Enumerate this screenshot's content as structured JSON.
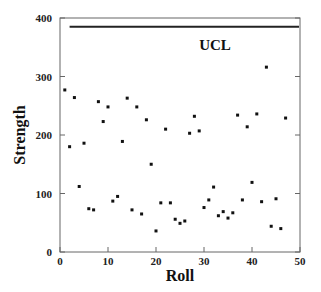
{
  "chart_data": {
    "type": "scatter",
    "title": "",
    "xlabel": "Roll",
    "ylabel": "Strength",
    "xlim": [
      0,
      50
    ],
    "ylim": [
      0,
      400
    ],
    "x_ticks": [
      0,
      10,
      20,
      30,
      40,
      50
    ],
    "y_ticks": [
      0,
      100,
      200,
      300,
      400
    ],
    "grid": false,
    "legend": null,
    "annotations": [
      {
        "type": "hline",
        "label": "UCL",
        "y": 385,
        "x_start": 2,
        "x_end": 50
      }
    ],
    "series": [
      {
        "name": "Strength",
        "marker": "square",
        "x": [
          1,
          2,
          3,
          4,
          5,
          6,
          7,
          8,
          9,
          10,
          11,
          12,
          13,
          14,
          15,
          16,
          17,
          18,
          19,
          20,
          21,
          22,
          23,
          24,
          25,
          26,
          27,
          28,
          29,
          30,
          31,
          32,
          33,
          34,
          35,
          36,
          37,
          38,
          39,
          40,
          41,
          42,
          43,
          44,
          45,
          46,
          47
        ],
        "y": [
          277,
          180,
          264,
          112,
          186,
          74,
          72,
          257,
          223,
          248,
          87,
          95,
          189,
          263,
          72,
          248,
          65,
          226,
          150,
          36,
          84,
          210,
          84,
          56,
          49,
          53,
          203,
          232,
          207,
          76,
          89,
          111,
          62,
          69,
          58,
          67,
          234,
          89,
          214,
          119,
          236,
          86,
          316,
          44,
          91,
          40,
          229
        ]
      }
    ]
  },
  "labels": {
    "xlabel": "Roll",
    "ylabel": "Strength",
    "ucl": "UCL",
    "x_ticks": [
      "0",
      "10",
      "20",
      "30",
      "40",
      "50"
    ],
    "y_ticks": [
      "0",
      "100",
      "200",
      "300",
      "400"
    ]
  }
}
